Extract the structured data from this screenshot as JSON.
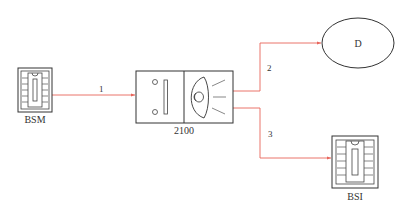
{
  "nodes": {
    "bsm": {
      "label": "BSM",
      "type": "ecu-module"
    },
    "unit2100": {
      "label": "2100",
      "type": "light-switch-unit"
    },
    "d": {
      "label": "D",
      "type": "ellipse-node"
    },
    "bsi": {
      "label": "BSI",
      "type": "ecu-module"
    }
  },
  "wires": [
    {
      "id": "1",
      "label": "1",
      "from": "BSM",
      "to": "2100"
    },
    {
      "id": "2",
      "label": "2",
      "from": "2100",
      "to": "D"
    },
    {
      "id": "3",
      "label": "3",
      "from": "2100",
      "to": "BSI"
    }
  ],
  "colors": {
    "wire": "#e8645a",
    "outline": "#333333"
  }
}
